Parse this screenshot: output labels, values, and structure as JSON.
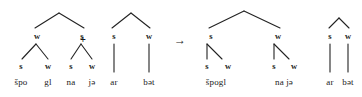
{
  "diagram": {
    "type": "metrical-stress-tree",
    "stroke_color": "#222222",
    "text_color": "#1a1a1a",
    "background": "#ffffff",
    "operators": [
      {
        "id": "plus",
        "symbol": "+",
        "x": 83,
        "y": 40
      },
      {
        "id": "arrow",
        "symbol": "→",
        "x": 180,
        "y": 40
      }
    ],
    "node_labels": {
      "strong": "s",
      "weak": "w"
    },
    "trees": [
      {
        "id": "input-tree-1",
        "role": "input",
        "nodes": [
          {
            "id": "t1-left",
            "label": "w",
            "x": 37,
            "y": 36
          },
          {
            "id": "t1-right",
            "label": "s",
            "x": 82,
            "y": 36
          },
          {
            "id": "t1-l-s",
            "label": "s",
            "x": 21,
            "y": 66
          },
          {
            "id": "t1-l-w",
            "label": "w",
            "x": 48,
            "y": 66
          },
          {
            "id": "t1-r-s",
            "label": "s",
            "x": 71,
            "y": 66
          },
          {
            "id": "t1-r-w",
            "label": "w",
            "x": 92,
            "y": 66
          }
        ],
        "terminals": [
          {
            "id": "t1-f1",
            "text": "špo",
            "x": 21,
            "y": 82
          },
          {
            "id": "t1-f2",
            "text": "gl",
            "x": 48,
            "y": 82
          },
          {
            "id": "t1-f3",
            "text": "na",
            "x": 71,
            "y": 82
          },
          {
            "id": "t1-f4",
            "text": "jə",
            "x": 92,
            "y": 82
          }
        ]
      },
      {
        "id": "input-tree-2",
        "role": "input",
        "nodes": [
          {
            "id": "t2-left",
            "label": "s",
            "x": 114,
            "y": 36
          },
          {
            "id": "t2-right",
            "label": "w",
            "x": 149,
            "y": 36
          }
        ],
        "terminals": [
          {
            "id": "t2-f1",
            "text": "ar",
            "x": 114,
            "y": 82
          },
          {
            "id": "t2-f2",
            "text": "bət",
            "x": 149,
            "y": 82
          }
        ]
      },
      {
        "id": "output-tree",
        "role": "output",
        "nodes": [
          {
            "id": "o-left",
            "label": "s",
            "x": 211,
            "y": 36
          },
          {
            "id": "o-right",
            "label": "w",
            "x": 278,
            "y": 36
          },
          {
            "id": "o-l-s",
            "label": "s",
            "x": 207,
            "y": 66
          },
          {
            "id": "o-l-w",
            "label": "w",
            "x": 228,
            "y": 66
          },
          {
            "id": "o-r-s",
            "label": "s",
            "x": 274,
            "y": 66
          },
          {
            "id": "o-r-w",
            "label": "w",
            "x": 294,
            "y": 66
          }
        ],
        "terminals": [
          {
            "id": "o-f1",
            "text": "špogl",
            "x": 216,
            "y": 82
          },
          {
            "id": "o-f2",
            "text": "na jə",
            "x": 284,
            "y": 82
          }
        ]
      },
      {
        "id": "output-tree-2",
        "role": "output",
        "nodes": [
          {
            "id": "o2-s",
            "label": "s",
            "x": 330,
            "y": 36
          },
          {
            "id": "o2-w",
            "label": "w",
            "x": 348,
            "y": 36
          }
        ],
        "terminals": [
          {
            "id": "o2-f1",
            "text": "ar",
            "x": 330,
            "y": 82
          },
          {
            "id": "o2-f2",
            "text": "bət",
            "x": 348,
            "y": 82
          }
        ]
      }
    ]
  }
}
